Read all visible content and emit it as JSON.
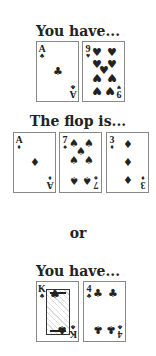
{
  "sections": [
    {
      "heading": "You have...",
      "cards": [
        {
          "rank": "A",
          "suit": "♣",
          "name": "ace-of-clubs"
        },
        {
          "rank": "9",
          "suit": "♥",
          "name": "nine-of-hearts"
        }
      ]
    },
    {
      "heading": "The flop is...",
      "cards": [
        {
          "rank": "A",
          "suit": "♦",
          "name": "ace-of-diamonds"
        },
        {
          "rank": "7",
          "suit": "♠",
          "name": "seven-of-spades"
        },
        {
          "rank": "3",
          "suit": "♦",
          "name": "three-of-diamonds"
        }
      ]
    },
    {
      "separator": "or"
    },
    {
      "heading": "You have...",
      "cards": [
        {
          "rank": "K",
          "suit": "♣",
          "name": "king-of-clubs"
        },
        {
          "rank": "4",
          "suit": "♣",
          "name": "four-of-clubs"
        }
      ]
    }
  ]
}
